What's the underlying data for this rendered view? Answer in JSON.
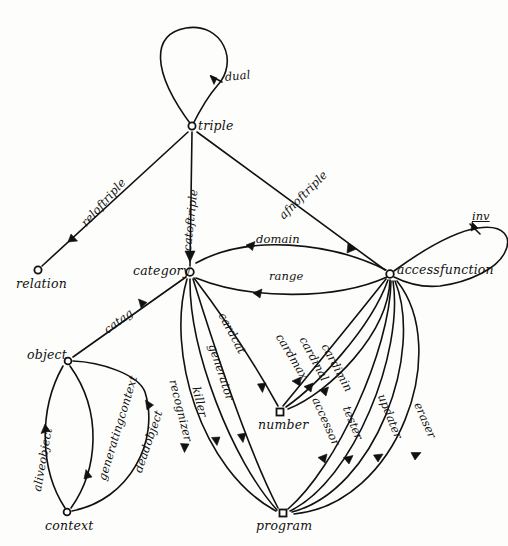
{
  "diagram": {
    "nodes": [
      {
        "id": "triple",
        "label": "triple",
        "x": 192,
        "y": 126,
        "lx": 198,
        "ly": 118,
        "shape": "circle"
      },
      {
        "id": "relation",
        "label": "relation",
        "x": 38,
        "y": 270,
        "lx": 16,
        "ly": 276,
        "shape": "circle"
      },
      {
        "id": "category",
        "label": "category",
        "x": 190,
        "y": 272,
        "lx": 133,
        "ly": 263,
        "shape": "circle"
      },
      {
        "id": "accessfunction",
        "label": "accessfunction",
        "x": 390,
        "y": 274,
        "lx": 397,
        "ly": 262,
        "shape": "circle"
      },
      {
        "id": "object",
        "label": "object",
        "x": 68,
        "y": 361,
        "lx": 27,
        "ly": 347,
        "shape": "circle"
      },
      {
        "id": "context",
        "label": "context",
        "x": 67,
        "y": 512,
        "lx": 45,
        "ly": 518,
        "shape": "circle"
      },
      {
        "id": "number",
        "label": "number",
        "x": 280,
        "y": 412,
        "lx": 258,
        "ly": 417,
        "shape": "square"
      },
      {
        "id": "program",
        "label": "program",
        "x": 283,
        "y": 513,
        "lx": 256,
        "ly": 518,
        "shape": "square"
      }
    ],
    "edges": [
      {
        "id": "dual",
        "label": "dual",
        "from": "triple",
        "to": "triple",
        "labelx": 224,
        "labely": 70,
        "rot": -6
      },
      {
        "id": "reloftriple",
        "label": "reloftriple",
        "from": "triple",
        "to": "relation",
        "labelx": 78,
        "labely": 220,
        "rot": -48
      },
      {
        "id": "catoftriple",
        "label": "catoftriple",
        "from": "triple",
        "to": "category",
        "labelx": 180,
        "labely": 250,
        "rot": -84
      },
      {
        "id": "afnoftriple",
        "label": "afnoftriple",
        "from": "triple",
        "to": "accessfunction",
        "labelx": 276,
        "labely": 212,
        "rot": -45
      },
      {
        "id": "inv",
        "label": "inv",
        "from": "accessfunction",
        "to": "accessfunction",
        "labelx": 472,
        "labely": 216,
        "rot": 0
      },
      {
        "id": "domain",
        "label": "domain",
        "from": "accessfunction",
        "to": "category",
        "labelx": 256,
        "labely": 243,
        "rot": 0
      },
      {
        "id": "range",
        "label": "range",
        "from": "accessfunction",
        "to": "category",
        "labelx": 269,
        "labely": 281,
        "rot": 0
      },
      {
        "id": "catag",
        "label": "catag",
        "from": "object",
        "to": "category",
        "labelx": 101,
        "labely": 325,
        "rot": -36
      },
      {
        "id": "aliveobject",
        "label": "aliveobject",
        "from": "context",
        "to": "object",
        "labelx": 30,
        "labely": 490,
        "rot": -80
      },
      {
        "id": "generatingcontext",
        "label": "generatingcontext",
        "from": "object",
        "to": "context",
        "labelx": 95,
        "labely": 478,
        "rot": -73
      },
      {
        "id": "deadobject",
        "label": "deadobject",
        "from": "context",
        "to": "object",
        "labelx": 131,
        "labely": 470,
        "rot": -71
      },
      {
        "id": "cardcat",
        "label": "cardcat",
        "from": "category",
        "to": "number",
        "labelx": 228,
        "labely": 310,
        "rot": 62
      },
      {
        "id": "generator",
        "label": "generator",
        "from": "category",
        "to": "program",
        "labelx": 219,
        "labely": 342,
        "rot": 72
      },
      {
        "id": "killer",
        "label": "killer",
        "from": "category",
        "to": "program",
        "labelx": 203,
        "labely": 385,
        "rot": 76
      },
      {
        "id": "recognizer",
        "label": "recognizer",
        "from": "category",
        "to": "program",
        "labelx": 180,
        "labely": 378,
        "rot": 76
      },
      {
        "id": "cardmax",
        "label": "cardmax",
        "from": "accessfunction",
        "to": "number",
        "labelx": 285,
        "labely": 331,
        "rot": 59
      },
      {
        "id": "cardinal",
        "label": "cardinal",
        "from": "accessfunction",
        "to": "number",
        "labelx": 309,
        "labely": 334,
        "rot": 62
      },
      {
        "id": "cardimin",
        "label": "cardimin",
        "from": "accessfunction",
        "to": "number",
        "labelx": 331,
        "labely": 341,
        "rot": 62
      },
      {
        "id": "accessor",
        "label": "accessor",
        "from": "accessfunction",
        "to": "program",
        "labelx": 322,
        "labely": 395,
        "rot": 66
      },
      {
        "id": "tester",
        "label": "tester",
        "from": "accessfunction",
        "to": "program",
        "labelx": 353,
        "labely": 404,
        "rot": 68
      },
      {
        "id": "updater",
        "label": "updater",
        "from": "accessfunction",
        "to": "program",
        "labelx": 388,
        "labely": 392,
        "rot": 68
      },
      {
        "id": "eraser",
        "label": "eraser",
        "from": "accessfunction",
        "to": "program",
        "labelx": 424,
        "labely": 400,
        "rot": 66
      }
    ]
  }
}
